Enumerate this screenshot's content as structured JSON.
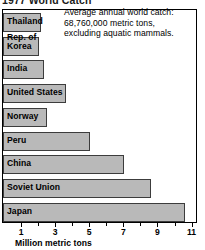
{
  "title": "1977 World Catch",
  "note": {
    "line1": "Average annual world catch:",
    "line2": "68,760,000 metric tons,",
    "line3": "excluding aquatic mammals."
  },
  "axis": {
    "title": "Million metric tons",
    "tick_labels": [
      "1",
      "3",
      "5",
      "7",
      "9",
      "11"
    ],
    "minor_ticks": [
      "2",
      "4",
      "6",
      "8",
      "10"
    ]
  },
  "chart_data": {
    "type": "bar",
    "orientation": "horizontal",
    "title": "1977 World Catch",
    "xlabel": "Million metric tons",
    "ylabel": "",
    "xlim": [
      0,
      11.3
    ],
    "grid": false,
    "legend": false,
    "annotation": "Average annual world catch: 68,760,000 metric tons, excluding aquatic mammals.",
    "bar_color": "#b9b9b9",
    "bar_edge_color": "#3c3c3c",
    "categories": [
      "Thailand",
      "Rep. of Korea",
      "India",
      "United States",
      "Norway",
      "Peru",
      "China",
      "Soviet Union",
      "Japan"
    ],
    "values": [
      2.2,
      2.1,
      2.4,
      3.7,
      2.6,
      5.1,
      7.1,
      8.7,
      10.7
    ],
    "units": "million metric tons",
    "bars": [
      {
        "label": "Thailand",
        "label_lines": [
          "Thailand"
        ],
        "value": 2.2
      },
      {
        "label": "Rep. of Korea",
        "label_lines": [
          "Rep. of",
          "Korea"
        ],
        "value": 2.1
      },
      {
        "label": "India",
        "label_lines": [
          "India"
        ],
        "value": 2.4
      },
      {
        "label": "United States",
        "label_lines": [
          "United States"
        ],
        "value": 3.7
      },
      {
        "label": "Norway",
        "label_lines": [
          "Norway"
        ],
        "value": 2.6
      },
      {
        "label": "Peru",
        "label_lines": [
          "Peru"
        ],
        "value": 5.1
      },
      {
        "label": "China",
        "label_lines": [
          "China"
        ],
        "value": 7.1
      },
      {
        "label": "Soviet Union",
        "label_lines": [
          "Soviet Union"
        ],
        "value": 8.7
      },
      {
        "label": "Japan",
        "label_lines": [
          "Japan"
        ],
        "value": 10.7
      }
    ]
  }
}
